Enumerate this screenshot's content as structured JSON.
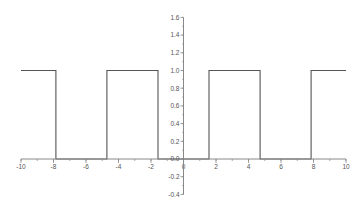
{
  "chart_data": {
    "type": "line",
    "title": "",
    "xlabel": "",
    "ylabel": "",
    "xlim": [
      -10,
      10
    ],
    "ylim": [
      -0.4,
      1.6
    ],
    "grid": false,
    "legend": null,
    "x_ticks": [
      -10,
      -8,
      -6,
      -4,
      -2,
      0,
      2,
      4,
      6,
      8,
      10
    ],
    "x_tick_labels": [
      "-10",
      "-8",
      "-6",
      "-4",
      "-2",
      "0",
      "2",
      "4",
      "6",
      "8",
      "10"
    ],
    "y_ticks": [
      -0.4,
      -0.2,
      0.0,
      0.2,
      0.4,
      0.6,
      0.8,
      1.0,
      1.2,
      1.4,
      1.6
    ],
    "y_tick_labels": [
      "-0.4",
      "-0.2",
      "0.0",
      "0.2",
      "0.4",
      "0.6",
      "0.8",
      "1.0",
      "1.2",
      "1.4",
      "1.6"
    ],
    "series": [
      {
        "name": "square wave",
        "color": "#555555",
        "x": [
          -10,
          -7.854,
          -7.854,
          -4.712,
          -4.712,
          -1.571,
          -1.571,
          1.571,
          1.571,
          4.712,
          4.712,
          7.854,
          7.854,
          10
        ],
        "y": [
          1,
          1,
          0,
          0,
          1,
          1,
          0,
          0,
          1,
          1,
          0,
          0,
          1,
          1
        ]
      }
    ]
  },
  "colors": {
    "axis": "#888888",
    "line": "#555555",
    "label": "#555555"
  }
}
